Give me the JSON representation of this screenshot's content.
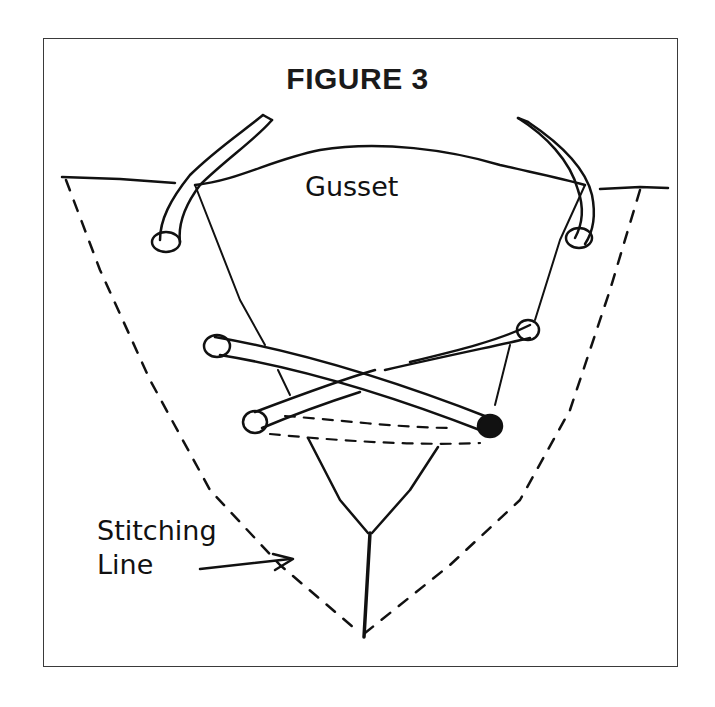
{
  "figure": {
    "title": "FIGURE 3",
    "labels": {
      "gusset": "Gusset",
      "stitching_line_1": "Stitching",
      "stitching_line_2": "Line"
    }
  },
  "colors": {
    "ink": "#111111",
    "background": "#ffffff",
    "frame": "#3a3a3a"
  }
}
